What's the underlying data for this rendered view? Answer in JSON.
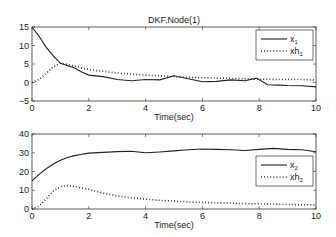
{
  "chart_data": [
    {
      "type": "line",
      "title": "DKF,Node(1)",
      "xlabel": "Time(sec)",
      "ylabel": "",
      "xlim": [
        0,
        10
      ],
      "ylim": [
        -5,
        15
      ],
      "xticks": [
        "0",
        "2",
        "4",
        "6",
        "8",
        "10"
      ],
      "yticks": [
        "-5",
        "0",
        "5",
        "10",
        "15"
      ],
      "grid": false,
      "legend_position": "upper right",
      "x": [
        0,
        0.25,
        0.5,
        0.75,
        1,
        1.25,
        1.5,
        1.75,
        2,
        2.5,
        3,
        3.5,
        4,
        4.5,
        5,
        5.5,
        6,
        6.5,
        7,
        7.5,
        7.9,
        8.3,
        8.7,
        9,
        9.5,
        10
      ],
      "series": [
        {
          "name": "x1",
          "legend_label": "x",
          "legend_sub": "1",
          "style": "solid",
          "values": [
            15,
            12.5,
            9.5,
            7.2,
            5.2,
            4.6,
            3.9,
            2.8,
            2.0,
            1.6,
            0.8,
            0.5,
            0.8,
            0.7,
            1.8,
            1.0,
            0.2,
            0.3,
            0.7,
            0.5,
            1.2,
            -0.6,
            -0.7,
            -0.8,
            -0.9,
            -1.2
          ]
        },
        {
          "name": "xh1",
          "legend_label": "xh",
          "legend_sub": "1",
          "style": "dotted",
          "values": [
            0,
            0.8,
            2.5,
            4.3,
            5.2,
            4.9,
            4.4,
            3.9,
            3.5,
            3.0,
            2.6,
            2.3,
            2.0,
            1.8,
            1.6,
            1.4,
            1.3,
            1.2,
            1.1,
            1.0,
            0.9,
            0.9,
            0.8,
            0.8,
            0.8,
            0.7
          ]
        }
      ]
    },
    {
      "type": "line",
      "title": "",
      "xlabel": "Time(sec)",
      "ylabel": "",
      "xlim": [
        0,
        10
      ],
      "ylim": [
        0,
        40
      ],
      "xticks": [
        "0",
        "2",
        "4",
        "6",
        "8",
        "10"
      ],
      "yticks": [
        "0",
        "10",
        "20",
        "30",
        "40"
      ],
      "grid": false,
      "legend_position": "center right",
      "x": [
        0,
        0.25,
        0.5,
        0.75,
        1,
        1.25,
        1.5,
        1.75,
        2,
        2.5,
        3,
        3.5,
        4,
        4.5,
        5,
        5.5,
        6,
        6.5,
        7,
        7.5,
        8,
        8.5,
        9,
        9.5,
        10
      ],
      "series": [
        {
          "name": "x2",
          "legend_label": "x",
          "legend_sub": "2",
          "style": "solid",
          "values": [
            15,
            18.5,
            21.5,
            24,
            26,
            27.5,
            28.5,
            29.2,
            29.8,
            30.2,
            30.6,
            30.8,
            30.0,
            30.4,
            31.0,
            31.6,
            32.0,
            31.8,
            31.6,
            31.2,
            31.8,
            32.3,
            31.8,
            31.6,
            30.5
          ]
        },
        {
          "name": "xh2",
          "legend_label": "xh",
          "legend_sub": "2",
          "style": "dotted",
          "values": [
            0,
            1.5,
            5.5,
            9.5,
            12,
            12.5,
            12,
            11.2,
            10.5,
            8.5,
            7.0,
            6.0,
            5.3,
            4.6,
            4.2,
            3.8,
            3.5,
            3.3,
            3.1,
            2.9,
            2.7,
            2.5,
            2.4,
            2.3,
            2.2
          ]
        }
      ]
    }
  ]
}
